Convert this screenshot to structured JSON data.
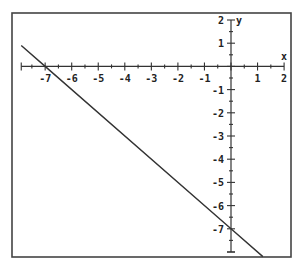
{
  "chart_data": {
    "type": "line",
    "title": "",
    "xlabel": "x",
    "ylabel": "y",
    "xlim": [
      -7.9,
      2
    ],
    "ylim": [
      -8,
      2
    ],
    "grid": false,
    "legend": null,
    "x_ticks": [
      -7,
      -6,
      -5,
      -4,
      -3,
      -2,
      -1,
      1,
      2
    ],
    "y_ticks": [
      2,
      1,
      -1,
      -2,
      -3,
      -4,
      -5,
      -6,
      -7
    ],
    "minor_ticks_per_unit": 2,
    "series": [
      {
        "name": "y = -x - 7",
        "equation": "y = -x - 7",
        "x": [
          -7.9,
          -7,
          0,
          1.2
        ],
        "y": [
          0.9,
          0,
          -7,
          -8.2
        ],
        "color": "#333333"
      }
    ],
    "annotations": {
      "x_intercept": [
        -7,
        0
      ],
      "y_intercept": [
        0,
        -7
      ]
    }
  },
  "frame": {
    "left": 12,
    "top": 13,
    "right": 291,
    "bottom": 257
  },
  "axes": {
    "origin_px": [
      231,
      66.4
    ],
    "x_scale_px": 26.55,
    "y_scale_px": 23.2,
    "x_axis_label": "x",
    "y_axis_label": "y"
  }
}
